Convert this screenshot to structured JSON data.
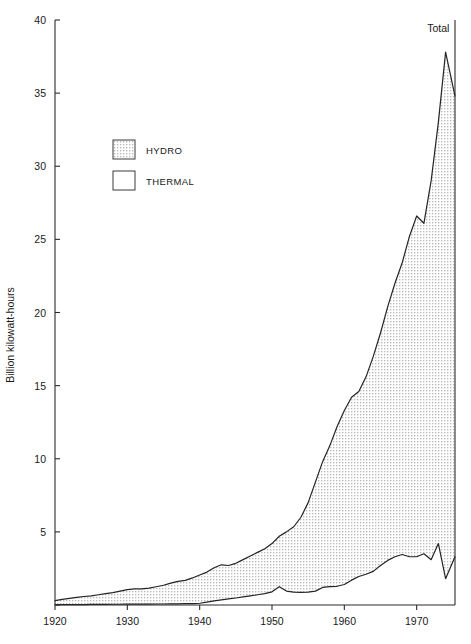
{
  "chart_data": {
    "type": "area",
    "title": "",
    "subtitle": "",
    "xlabel": "",
    "ylabel": "Billion kilowatt-hours",
    "xlim": [
      1920,
      1975.3
    ],
    "ylim": [
      0,
      40
    ],
    "grid": false,
    "legend_position": "upper-left-inset",
    "annotations": [
      {
        "text": "Total",
        "x": 1973,
        "y": 39.2
      }
    ],
    "x_ticks": [
      1920,
      1930,
      1940,
      1950,
      1960,
      1970
    ],
    "x_tick_labels": [
      "1920",
      "1930",
      "1940",
      "1950",
      "1960",
      "1970"
    ],
    "y_ticks": [
      0,
      5,
      10,
      15,
      20,
      25,
      30,
      35,
      40
    ],
    "y_tick_labels": [
      "",
      "5",
      "10",
      "15",
      "20",
      "25",
      "30",
      "35",
      "40"
    ],
    "stacking": "total-and-hydro",
    "legend": [
      {
        "name": "HYDRO",
        "fill": "stipple",
        "color": "#e9e9e9"
      },
      {
        "name": "THERMAL",
        "fill": "solid",
        "color": "#ffffff"
      }
    ],
    "x": [
      1920,
      1921,
      1922,
      1923,
      1924,
      1925,
      1926,
      1927,
      1928,
      1929,
      1930,
      1931,
      1932,
      1933,
      1934,
      1935,
      1936,
      1937,
      1938,
      1939,
      1940,
      1941,
      1942,
      1943,
      1944,
      1945,
      1946,
      1947,
      1948,
      1949,
      1950,
      1951,
      1952,
      1953,
      1954,
      1955,
      1956,
      1957,
      1958,
      1959,
      1960,
      1961,
      1962,
      1963,
      1964,
      1965,
      1966,
      1967,
      1968,
      1969,
      1970,
      1971,
      1972,
      1973,
      1974,
      1975.3
    ],
    "series": [
      {
        "name": "Total",
        "values": [
          0.3,
          0.38,
          0.45,
          0.52,
          0.58,
          0.62,
          0.7,
          0.78,
          0.85,
          0.95,
          1.05,
          1.1,
          1.1,
          1.15,
          1.25,
          1.35,
          1.5,
          1.62,
          1.68,
          1.85,
          2.05,
          2.25,
          2.55,
          2.75,
          2.7,
          2.85,
          3.1,
          3.35,
          3.6,
          3.85,
          4.2,
          4.7,
          5.0,
          5.35,
          6.0,
          7.0,
          8.4,
          9.8,
          10.9,
          12.2,
          13.3,
          14.2,
          14.6,
          15.6,
          17.0,
          18.6,
          20.4,
          22.0,
          23.4,
          25.2,
          26.6,
          26.1,
          29.0,
          33.0,
          37.8,
          34.8
        ]
      },
      {
        "name": "Hydro",
        "values": [
          0.02,
          0.02,
          0.03,
          0.03,
          0.03,
          0.04,
          0.04,
          0.04,
          0.05,
          0.05,
          0.06,
          0.06,
          0.06,
          0.06,
          0.07,
          0.07,
          0.08,
          0.08,
          0.09,
          0.1,
          0.12,
          0.2,
          0.28,
          0.35,
          0.42,
          0.48,
          0.55,
          0.62,
          0.7,
          0.78,
          0.9,
          1.25,
          0.95,
          0.88,
          0.86,
          0.88,
          0.95,
          1.2,
          1.25,
          1.28,
          1.4,
          1.7,
          1.95,
          2.1,
          2.3,
          2.7,
          3.05,
          3.3,
          3.45,
          3.3,
          3.3,
          3.5,
          3.1,
          4.2,
          1.8,
          3.3
        ]
      }
    ]
  }
}
